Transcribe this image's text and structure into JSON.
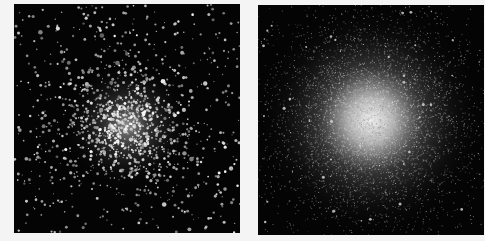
{
  "figure": {
    "background_color": "#f4f4f4",
    "panels": [
      {
        "id": "left",
        "description": "Globular cluster, resolved individual stars, sharp point-like stars scattered across field with dense bright core",
        "background_color": "#040404",
        "core_center": [
          0.5,
          0.53
        ],
        "core_radius": 0.13,
        "star_count": 1400,
        "resolved": true
      },
      {
        "id": "right",
        "description": "Globular cluster, unresolved smooth diffuse glow with bright center and few field stars",
        "background_color": "#040404",
        "core_center": [
          0.5,
          0.5
        ],
        "core_radius": 0.2,
        "star_count": 6000,
        "resolved": false
      }
    ]
  }
}
